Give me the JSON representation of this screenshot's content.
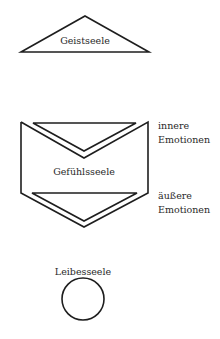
{
  "diagram": {
    "colors": {
      "stroke": "#1e1e1e",
      "text": "#2a2a2a",
      "background": "#ffffff"
    },
    "nodes": [
      {
        "id": "geistseele",
        "label": "Geistseele",
        "shape": "triangle"
      },
      {
        "id": "gefuehlsseele",
        "label": "Gefühlsseele",
        "shape": "pentagon-with-chevrons"
      },
      {
        "id": "leibesseele",
        "label": "Leibesseele",
        "shape": "circle"
      }
    ],
    "annotations": [
      {
        "id": "innere",
        "line1": "innere",
        "line2": "Emotionen"
      },
      {
        "id": "aeussere",
        "line1": "äußere",
        "line2": "Emotionen"
      }
    ]
  }
}
